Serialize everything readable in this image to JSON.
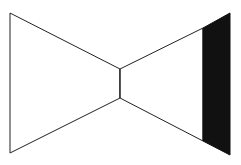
{
  "diagram": {
    "colors": {
      "background": "#ffffff",
      "stroke": "#222222",
      "fill_band": "#111111"
    },
    "shapes": {
      "left_triangle": "10,13 120,69 120,98 10,153",
      "connector": "120,69 120,98",
      "right_wing": "120,69 203,28 203,141 120,98",
      "black_band": "203,28 230,13 230,155 203,141"
    }
  }
}
